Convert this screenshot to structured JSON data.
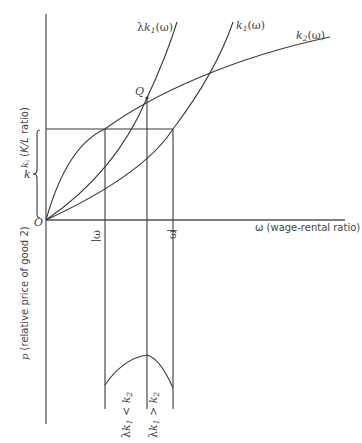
{
  "figure": {
    "top_panel": {
      "y_axis_label": "k_i (K/L ratio)",
      "y_axis_label_parts": {
        "var": "k",
        "sub": "i",
        "rest": " (K/L ratio)"
      },
      "x_axis_label": "ω (wage-rental ratio)",
      "origin_label": "O",
      "point_label": "Q",
      "bracket_label": "k",
      "omega_lower_label": "ω",
      "omega_upper_label": "ω",
      "curves": [
        {
          "name": "lambda-k1",
          "label": "λk",
          "sub": "1",
          "suffix": "(ω)"
        },
        {
          "name": "k1",
          "label": "k",
          "sub": "1",
          "suffix": "(ω)"
        },
        {
          "name": "k2",
          "label": "k",
          "sub": "2",
          "suffix": "(ω)"
        }
      ]
    },
    "bottom_panel": {
      "y_axis_label": "p (relative price of good 2)",
      "y_axis_label_parts": {
        "var": "p",
        "rest": " (relative price of good 2)"
      },
      "region_labels": [
        {
          "text": "λk",
          "sub": "1",
          "rel": " < ",
          "rhs": "k",
          "rhs_sub": "2"
        },
        {
          "text": "λk",
          "sub": "1",
          "rel": " > ",
          "rhs": "k",
          "rhs_sub": "2"
        }
      ]
    }
  }
}
